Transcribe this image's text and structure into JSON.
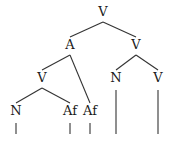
{
  "tree": {
    "nodes": [
      {
        "id": "root",
        "label": "V"
      },
      {
        "id": "a",
        "label": "A"
      },
      {
        "id": "vr",
        "label": "V"
      },
      {
        "id": "vl",
        "label": "V"
      },
      {
        "id": "n1",
        "label": "N"
      },
      {
        "id": "af1",
        "label": "Af"
      },
      {
        "id": "af2",
        "label": "Af"
      },
      {
        "id": "n2",
        "label": "N"
      },
      {
        "id": "v2",
        "label": "V"
      }
    ],
    "edges": [
      [
        "root",
        "a"
      ],
      [
        "root",
        "vr"
      ],
      [
        "a",
        "vl"
      ],
      [
        "a",
        "af2"
      ],
      [
        "vl",
        "n1"
      ],
      [
        "vl",
        "af1"
      ],
      [
        "vr",
        "n2"
      ],
      [
        "vr",
        "v2"
      ]
    ],
    "stems": [
      "n1",
      "af1",
      "af2",
      "n2",
      "v2"
    ]
  }
}
